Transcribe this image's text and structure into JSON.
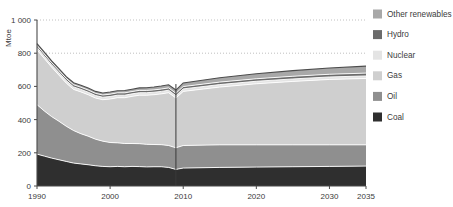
{
  "chart_data": {
    "type": "area",
    "stacked": true,
    "title": "",
    "subtitle": "",
    "xlabel": "",
    "ylabel": "Mtoe",
    "ylim": [
      0,
      1000
    ],
    "xlim": [
      1990,
      2035
    ],
    "yticks": [
      "0",
      "200",
      "400",
      "600",
      "800",
      "1 000"
    ],
    "ytick_values": [
      0,
      200,
      400,
      600,
      800,
      1000
    ],
    "xticks": [
      "1990",
      "2000",
      "2010",
      "2020",
      "2030",
      "2035"
    ],
    "xtick_values": [
      1990,
      2000,
      2010,
      2020,
      2030,
      2035
    ],
    "grid": "dotted-horizontal-upper",
    "gridline_values": [
      800,
      1000
    ],
    "legend_position": "right",
    "projection_divider_year": 2009,
    "x": [
      1990,
      1991,
      1992,
      1993,
      1994,
      1995,
      1996,
      1997,
      1998,
      1999,
      2000,
      2001,
      2002,
      2003,
      2004,
      2005,
      2006,
      2007,
      2008,
      2009,
      2010,
      2015,
      2020,
      2025,
      2030,
      2035
    ],
    "series": [
      {
        "name": "Coal",
        "color": "#2f2f2f",
        "values": [
          192,
          180,
          168,
          158,
          148,
          138,
          133,
          128,
          122,
          118,
          116,
          118,
          116,
          118,
          117,
          115,
          116,
          116,
          112,
          100,
          108,
          112,
          114,
          116,
          118,
          120
        ]
      },
      {
        "name": "Oil",
        "color": "#8f8f8f",
        "values": [
          298,
          272,
          250,
          232,
          212,
          196,
          182,
          172,
          160,
          152,
          146,
          142,
          140,
          138,
          138,
          136,
          134,
          133,
          132,
          130,
          136,
          136,
          134,
          132,
          130,
          128
        ]
      },
      {
        "name": "Gas",
        "color": "#cfcfcf",
        "values": [
          330,
          316,
          298,
          278,
          260,
          248,
          252,
          250,
          248,
          250,
          262,
          272,
          276,
          284,
          292,
          296,
          300,
          306,
          318,
          300,
          326,
          348,
          368,
          382,
          394,
          400
        ]
      },
      {
        "name": "Nuclear",
        "color": "#e4e4e4",
        "values": [
          14,
          14,
          14,
          15,
          15,
          15,
          15,
          15,
          15,
          15,
          15,
          15,
          15,
          15,
          15,
          15,
          15,
          15,
          15,
          14,
          15,
          15,
          15,
          15,
          15,
          15
        ]
      },
      {
        "name": "Hydro",
        "color": "#6b6b6b",
        "values": [
          13,
          13,
          13,
          13,
          13,
          13,
          13,
          13,
          13,
          13,
          14,
          14,
          14,
          14,
          14,
          14,
          14,
          14,
          14,
          14,
          14,
          15,
          15,
          16,
          16,
          17
        ]
      },
      {
        "name": "Other renewables",
        "color": "#a8a8a8",
        "values": [
          11,
          11,
          11,
          11,
          11,
          12,
          12,
          12,
          12,
          12,
          13,
          13,
          14,
          14,
          15,
          16,
          17,
          18,
          19,
          20,
          22,
          26,
          30,
          34,
          38,
          42
        ]
      }
    ],
    "legend": [
      {
        "label": "Other renewables",
        "color": "#a8a8a8"
      },
      {
        "label": "Hydro",
        "color": "#6b6b6b"
      },
      {
        "label": "Nuclear",
        "color": "#e4e4e4"
      },
      {
        "label": "Gas",
        "color": "#cfcfcf"
      },
      {
        "label": "Oil",
        "color": "#8f8f8f"
      },
      {
        "label": "Coal",
        "color": "#2f2f2f"
      }
    ]
  }
}
